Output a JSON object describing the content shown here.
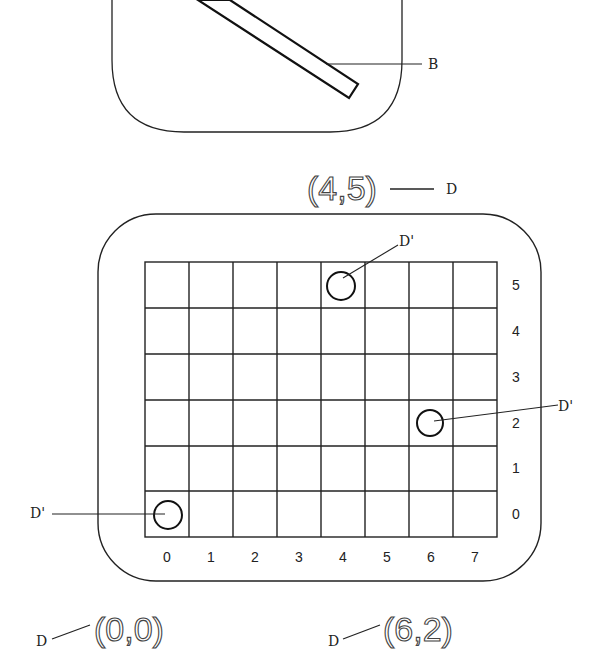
{
  "figure": {
    "top_panel": {
      "bar_label": "B"
    },
    "top_coord": {
      "text": "(4,5)",
      "label": "D"
    },
    "grid": {
      "columns": 8,
      "rows": 6,
      "x_labels": [
        "0",
        "1",
        "2",
        "3",
        "4",
        "5",
        "6",
        "7"
      ],
      "y_labels": [
        "5",
        "4",
        "3",
        "2",
        "1",
        "0"
      ]
    },
    "markers": [
      {
        "label": "D'",
        "col": 4,
        "row": 5
      },
      {
        "label": "D'",
        "col": 6,
        "row": 2
      },
      {
        "label": "D'",
        "col": 0,
        "row": 0
      }
    ],
    "bottom_coords": [
      {
        "text": "(0,0)",
        "label": "D"
      },
      {
        "text": "(6,2)",
        "label": "D"
      }
    ]
  }
}
